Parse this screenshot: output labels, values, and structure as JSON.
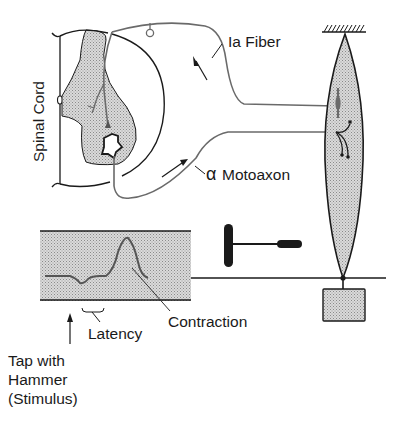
{
  "labels": {
    "spinal_cord": "Spinal Cord",
    "ia_fiber": "Ia Fiber",
    "motoaxon_greek": "α",
    "motoaxon": "Motoaxon",
    "contraction": "Contraction",
    "latency": "Latency",
    "stimulus_line1": "Tap with",
    "stimulus_line2": "Hammer",
    "stimulus_line3": "(Stimulus)"
  },
  "colors": {
    "ink": "#1a1a1a",
    "stipple": "#c8c8c8",
    "nerve": "#6a6a6a",
    "background": "#ffffff"
  },
  "icons": {
    "hammer": "reflex-hammer-icon",
    "weight": "weight-block-icon",
    "ceiling": "fixed-support-icon"
  }
}
